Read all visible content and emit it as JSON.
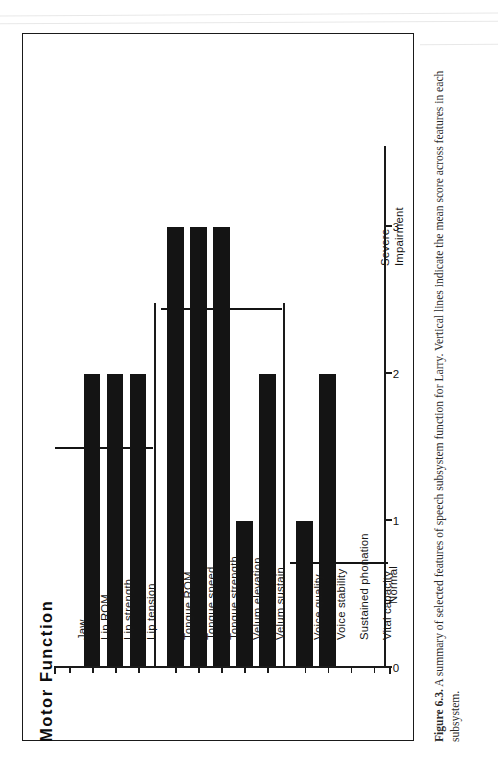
{
  "figure": {
    "caption_label": "Figure 6.3.",
    "caption_text": "A summary of selected features of speech subsystem function for Larry. Vertical lines indicate the mean score across features in each subsystem."
  },
  "axis_titles": {
    "category_axis_title": "Motor  Function"
  },
  "endpoints": {
    "low": "Normal",
    "high_line1": "Severe",
    "high_line2": "Impairment"
  },
  "groups": [
    {
      "name": "Lip/Jaw",
      "mean": 1.5
    },
    {
      "name": "Tongue/Velum",
      "mean": 2.45
    },
    {
      "name": "Resp/Phonatory",
      "mean": 0.72
    }
  ],
  "chart_data": {
    "type": "bar",
    "orientation": "horizontal",
    "title": "Motor  Function",
    "xlabel": "Motor  Function",
    "ylabel": "",
    "ylim": [
      0,
      3.55
    ],
    "ticks": [
      0,
      1,
      2,
      3
    ],
    "tick_labels": [
      "0",
      "1",
      "2",
      "3"
    ],
    "grid": false,
    "scale_low_label": "Normal",
    "scale_high_label": "Severe Impairment",
    "categories": [
      "Jaw",
      "Lip ROM",
      "Lip strength",
      "Lip tension",
      "Tongue ROM",
      "Tongue speed",
      "Tongue strength",
      "Velum elevation",
      "Velum sustain",
      "Voice quality",
      "Voice stability",
      "Sustained phonation",
      "Vital capacity"
    ],
    "values": [
      0,
      2,
      2,
      2,
      3,
      3,
      3,
      1,
      2,
      1,
      2,
      0,
      0
    ],
    "group_means": [
      {
        "group": "Lip/Jaw",
        "value": 1.5,
        "members": [
          "Jaw",
          "Lip ROM",
          "Lip strength",
          "Lip tension"
        ]
      },
      {
        "group": "Tongue/Velum",
        "value": 2.45,
        "members": [
          "Tongue ROM",
          "Tongue speed",
          "Tongue strength",
          "Velum elevation",
          "Velum sustain"
        ]
      },
      {
        "group": "Resp/Phonatory",
        "value": 0.72,
        "members": [
          "Voice quality",
          "Voice stability",
          "Sustained phonation",
          "Vital capacity"
        ]
      }
    ],
    "annotations": [
      "Lip/Jaw",
      "Tongue/Velum",
      "Resp/Phonatory"
    ]
  }
}
